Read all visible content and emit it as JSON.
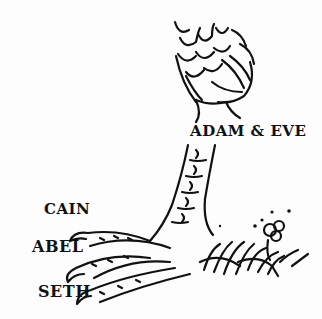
{
  "illustration": {
    "subject": "bird-foot-line-drawing",
    "labels": {
      "leg": "ADAM & EVE",
      "toe_top": "CAIN",
      "toe_middle": "ABEL",
      "toe_bottom": "SETH"
    },
    "colors": {
      "ink": "#111111",
      "paper": "#fdfdfd"
    }
  }
}
